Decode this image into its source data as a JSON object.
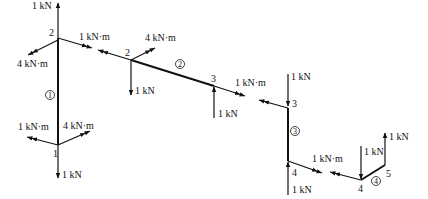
{
  "members": [
    {
      "id": "1",
      "label": "1",
      "circle_label": "①"
    },
    {
      "id": "2",
      "label": "2",
      "circle_label": "②"
    },
    {
      "id": "3",
      "label": "3",
      "circle_label": "③"
    },
    {
      "id": "4",
      "label": "4",
      "circle_label": "④"
    }
  ],
  "joints": {
    "m1_top": "2",
    "m1_bottom": "1",
    "m2_left": "2",
    "m2_right": "3",
    "m3_top": "3",
    "m3_bottom": "4",
    "m4_left": "4",
    "m4_right": "5"
  },
  "loads": {
    "m1_top_force": "1 kN",
    "m1_top_moment_left": "4 kN·m",
    "m1_top_moment_right": "1 kN·m",
    "m1_bottom_moment_left": "1 kN·m",
    "m1_bottom_moment_right": "4 kN·m",
    "m1_bottom_force": "1 kN",
    "m2_left_moment": "4 kN·m",
    "m2_left_force": "1 kN",
    "m2_right_force": "1 kN",
    "m2_right_moment": "1 kN·m",
    "m3_top_force": "1 kN",
    "m3_bottom_force": "1 kN",
    "m3_bottom_moment": "1 kN·m",
    "m4_left_force": "1 kN",
    "m4_right_force": "1 kN"
  }
}
